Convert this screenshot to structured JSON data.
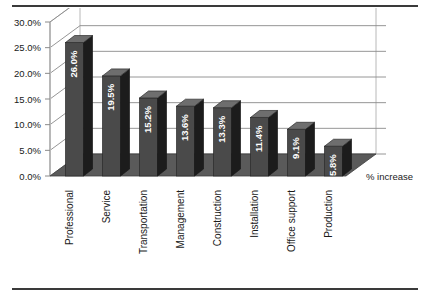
{
  "chart_data": {
    "type": "bar",
    "title": "",
    "subtitle": "",
    "xlabel": "",
    "ylabel": "",
    "series_label": "% increase",
    "legend_position": "right",
    "grid": true,
    "three_d": true,
    "ylim": [
      0,
      30
    ],
    "ytick_labels": [
      "0.0%",
      "5.0%",
      "10.0%",
      "15.0%",
      "20.0%",
      "25.0%",
      "30.0%"
    ],
    "ytick_values": [
      0,
      5,
      10,
      15,
      20,
      25,
      30
    ],
    "categories": [
      "Professional",
      "Service",
      "Transportation",
      "Management",
      "Construction",
      "Installation",
      "Office support",
      "Production"
    ],
    "values": [
      26.0,
      19.5,
      15.2,
      13.6,
      13.3,
      11.4,
      9.1,
      5.8
    ],
    "data_labels": [
      "26.0%",
      "19.5%",
      "15.2%",
      "13.6%",
      "13.3%",
      "11.4%",
      "9.1%",
      "5.8%"
    ],
    "series": [
      {
        "name": "% increase",
        "values": [
          26.0,
          19.5,
          15.2,
          13.6,
          13.3,
          11.4,
          9.1,
          5.8
        ]
      }
    ],
    "colors": {
      "bar_front": "#4a4a4a",
      "bar_side": "#1c1c1c",
      "bar_top": "#6e6e6e",
      "floor": "#5a5a5a",
      "gridline": "#8a8a8a",
      "axis": "#b8b8b8",
      "text": "#1a1a1a",
      "data_label": "#ffffff",
      "rule": "#3a3a3a",
      "background": "#ffffff"
    }
  }
}
